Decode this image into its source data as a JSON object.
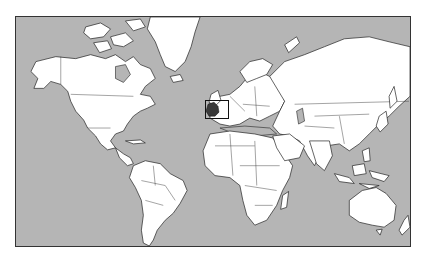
{
  "map": {
    "title": "World map with France highlighted",
    "projection": "Mercator",
    "highlighted_country": "France",
    "highlight_box": {
      "x": 204,
      "y": 99,
      "width": 24,
      "height": 19
    },
    "colors": {
      "ocean": "#b5b5b5",
      "land": "#ffffff",
      "borders": "#222222",
      "highlight": "#3a3a3a",
      "page_background": "#ffffff"
    }
  }
}
